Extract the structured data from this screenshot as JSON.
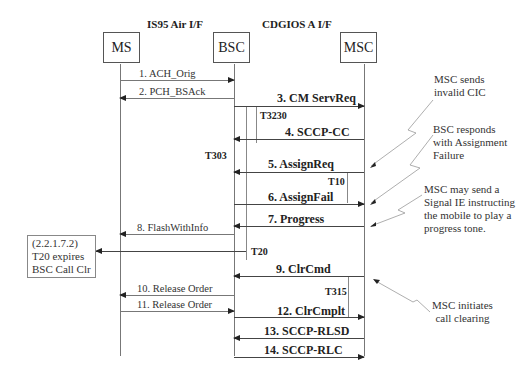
{
  "headers": {
    "left": "IS95 Air I/F",
    "right": "CDGIOS A I/F"
  },
  "entities": [
    {
      "id": "ms",
      "label": "MS"
    },
    {
      "id": "bsc",
      "label": "BSC"
    },
    {
      "id": "msc",
      "label": "MSC"
    }
  ],
  "messages": [
    {
      "n": 1,
      "label": "1. ACH_Orig",
      "from": "MS",
      "to": "BSC"
    },
    {
      "n": 2,
      "label": "2.  PCH_BSAck",
      "from": "BSC",
      "to": "MS"
    },
    {
      "n": 3,
      "label": "3. CM ServReq",
      "from": "BSC",
      "to": "MSC"
    },
    {
      "n": 4,
      "label": "4. SCCP-CC",
      "from": "MSC",
      "to": "BSC"
    },
    {
      "n": 5,
      "label": "5. AssignReq",
      "from": "MSC",
      "to": "BSC"
    },
    {
      "n": 6,
      "label": "6. AssignFail",
      "from": "BSC",
      "to": "MSC"
    },
    {
      "n": 7,
      "label": "7. Progress",
      "from": "MSC",
      "to": "BSC"
    },
    {
      "n": 8,
      "label": "8.  FlashWithInfo",
      "from": "BSC",
      "to": "MS"
    },
    {
      "n": 9,
      "label": "9. ClrCmd",
      "from": "MSC",
      "to": "BSC"
    },
    {
      "n": 10,
      "label": "10. Release Order",
      "from": "BSC",
      "to": "MS"
    },
    {
      "n": 11,
      "label": "11. Release Order",
      "from": "MS",
      "to": "BSC"
    },
    {
      "n": 12,
      "label": "12. ClrCmplt",
      "from": "BSC",
      "to": "MSC"
    },
    {
      "n": 13,
      "label": "13. SCCP-RLSD",
      "from": "MSC",
      "to": "BSC"
    },
    {
      "n": 14,
      "label": "14. SCCP-RLC",
      "from": "BSC",
      "to": "MSC"
    }
  ],
  "timers": {
    "t3230": "T3230",
    "t303": "T303",
    "t10": "T10",
    "t20": "T20",
    "t315": "T315"
  },
  "notes": {
    "invalid_cic": [
      "MSC sends",
      "invalid CIC"
    ],
    "assign_failure": [
      "BSC responds",
      "with Assignment",
      "Failure"
    ],
    "signal_ie": [
      "MSC may send a",
      "Signal IE instructing",
      "the mobile to play a",
      "progress tone."
    ],
    "call_clearing": [
      "MSC initiates",
      "call clearing"
    ],
    "t20_box": [
      "(2.2.1.7.2)",
      "T20 expires",
      "BSC Call Clr"
    ]
  }
}
